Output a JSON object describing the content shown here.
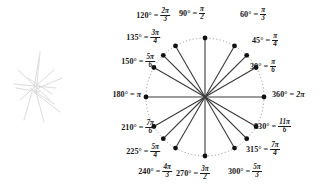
{
  "figure": {
    "type": "unit-circle-diagram",
    "center": {
      "x": 205,
      "y": 97
    },
    "radius": 59,
    "circle_style": "dotted",
    "circle_color": "#8c8c8c",
    "spoke_color": "#3a3a3a",
    "dot_color": "#111111",
    "label_color": "#1a1a1a"
  },
  "chart_data": {
    "type": "scatter",
    "xlabel": "",
    "ylabel": "",
    "angles_deg": [
      30,
      45,
      60,
      90,
      120,
      135,
      150,
      180,
      210,
      225,
      240,
      270,
      300,
      315,
      330,
      360
    ],
    "points": [
      {
        "deg": "30",
        "deg_label": "30°",
        "radian_num": "π",
        "radian_den": "6",
        "radian_plain": "",
        "anchor": "left",
        "lx": 250,
        "ly": 67
      },
      {
        "deg": "45",
        "deg_label": "45°",
        "radian_num": "π",
        "radian_den": "4",
        "radian_plain": "",
        "anchor": "left",
        "lx": 252,
        "ly": 41
      },
      {
        "deg": "60",
        "deg_label": "60°",
        "radian_num": "π",
        "radian_den": "3",
        "radian_plain": "",
        "anchor": "left",
        "lx": 240,
        "ly": 15
      },
      {
        "deg": "90",
        "deg_label": "90°",
        "radian_num": "π",
        "radian_den": "2",
        "radian_plain": "",
        "anchor": "center",
        "lx": 192,
        "ly": 14
      },
      {
        "deg": "120",
        "deg_label": "120°",
        "radian_num": "2π",
        "radian_den": "3",
        "radian_plain": "",
        "anchor": "right",
        "lx": 170,
        "ly": 16
      },
      {
        "deg": "135",
        "deg_label": "135°",
        "radian_num": "3π",
        "radian_den": "4",
        "radian_plain": "",
        "anchor": "right",
        "lx": 160,
        "ly": 38
      },
      {
        "deg": "150",
        "deg_label": "150°",
        "radian_num": "5π",
        "radian_den": "6",
        "radian_plain": "",
        "anchor": "right",
        "lx": 155,
        "ly": 62
      },
      {
        "deg": "180",
        "deg_label": "180°",
        "radian_num": "",
        "radian_den": "",
        "radian_plain": "π",
        "anchor": "right",
        "lx": 141,
        "ly": 95
      },
      {
        "deg": "210",
        "deg_label": "210°",
        "radian_num": "7π",
        "radian_den": "6",
        "radian_plain": "",
        "anchor": "right",
        "lx": 155,
        "ly": 128
      },
      {
        "deg": "225",
        "deg_label": "225°",
        "radian_num": "5π",
        "radian_den": "4",
        "radian_plain": "",
        "anchor": "right",
        "lx": 160,
        "ly": 152
      },
      {
        "deg": "240",
        "deg_label": "240°",
        "radian_num": "4π",
        "radian_den": "3",
        "radian_plain": "",
        "anchor": "right",
        "lx": 172,
        "ly": 172
      },
      {
        "deg": "270",
        "deg_label": "270°",
        "radian_num": "3π",
        "radian_den": "2",
        "radian_plain": "",
        "anchor": "left",
        "lx": 176,
        "ly": 174
      },
      {
        "deg": "300",
        "deg_label": "300°",
        "radian_num": "5π",
        "radian_den": "3",
        "radian_plain": "",
        "anchor": "left",
        "lx": 228,
        "ly": 172
      },
      {
        "deg": "315",
        "deg_label": "315°",
        "radian_num": "7π",
        "radian_den": "4",
        "radian_plain": "",
        "anchor": "left",
        "lx": 246,
        "ly": 150
      },
      {
        "deg": "330",
        "deg_label": "330°",
        "radian_num": "11π",
        "radian_den": "6",
        "radian_plain": "",
        "anchor": "left",
        "lx": 254,
        "ly": 127
      },
      {
        "deg": "360",
        "deg_label": "360°",
        "radian_num": "",
        "radian_den": "",
        "radian_plain": "2π",
        "anchor": "left",
        "lx": 272,
        "ly": 95
      }
    ],
    "equals_sign": "=",
    "degree_symbol": "°"
  },
  "artifact": {
    "name": "faint-pencil-sketch",
    "description": "faint gray hand-drawn starburst sketch"
  }
}
